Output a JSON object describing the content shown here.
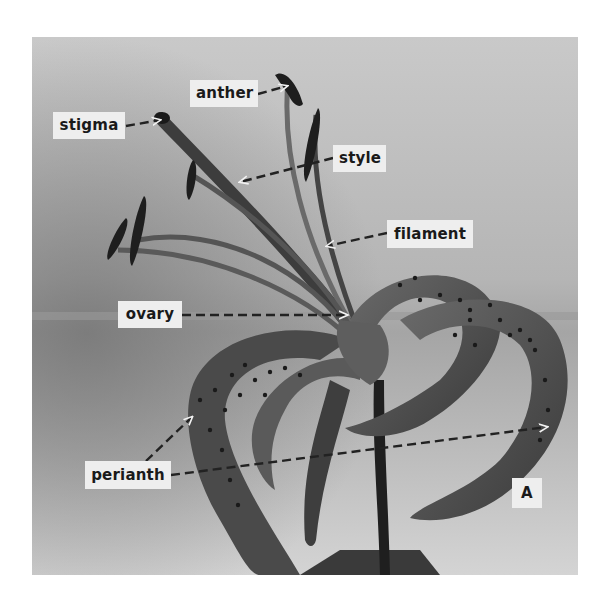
{
  "figure": {
    "panel_letter": "A",
    "colors": {
      "background_light": "#cfcfcf",
      "background_dark": "#8a8a8a",
      "plant_dark": "#2e2e2e",
      "plant_mid": "#555555",
      "label_box": "#eeeeee",
      "label_text": "#1a1a1a",
      "arrow": "#222222"
    }
  },
  "labels": [
    {
      "id": "stigma",
      "text": "stigma",
      "box": [
        53,
        112,
        72,
        27
      ],
      "arrow_from": [
        126,
        126
      ],
      "arrow_to": [
        160,
        120
      ]
    },
    {
      "id": "anther",
      "text": "anther",
      "box": [
        190,
        80,
        68,
        27
      ],
      "arrow_from": [
        258,
        94
      ],
      "arrow_to": [
        287,
        86
      ]
    },
    {
      "id": "style",
      "text": "style",
      "box": [
        333,
        145,
        53,
        27
      ],
      "arrow_from": [
        333,
        158
      ],
      "arrow_to": [
        240,
        182
      ]
    },
    {
      "id": "filament",
      "text": "filament",
      "box": [
        387,
        220,
        86,
        28
      ],
      "arrow_from": [
        387,
        233
      ],
      "arrow_to": [
        327,
        246
      ]
    },
    {
      "id": "ovary",
      "text": "ovary",
      "box": [
        118,
        301,
        64,
        27
      ],
      "arrow_from": [
        182,
        315
      ],
      "arrow_to": [
        347,
        315
      ]
    },
    {
      "id": "perianth",
      "text": "perianth",
      "box": [
        85,
        461,
        86,
        28
      ],
      "arrow_from": [
        171,
        475
      ],
      "arrow_to": [
        547,
        427
      ],
      "arrow2_from": [
        146,
        461
      ],
      "arrow2_to": [
        192,
        417
      ]
    },
    {
      "id": "panel",
      "text": "A",
      "box": [
        512,
        478,
        30,
        30
      ]
    }
  ]
}
